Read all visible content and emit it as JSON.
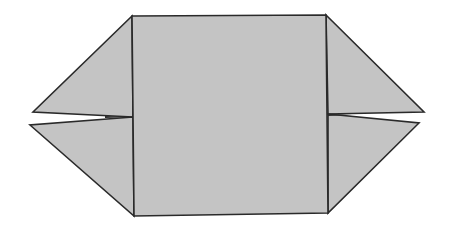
{
  "diagram": {
    "type": "origami-fold-step",
    "colors": {
      "paper": "#c4c4c4",
      "stroke": "#2a2a2a",
      "background": "#ffffff"
    },
    "shapes": {
      "square": "132,16 326,15 328,213 134,216",
      "left_upper_flap": "132,16 33,112 133,117",
      "left_lower_flap": "133,117 30,125 134,216",
      "right_upper_flap": "326,15 424,112 328,114",
      "right_lower_flap": "328,114 419,123 328,213"
    }
  }
}
